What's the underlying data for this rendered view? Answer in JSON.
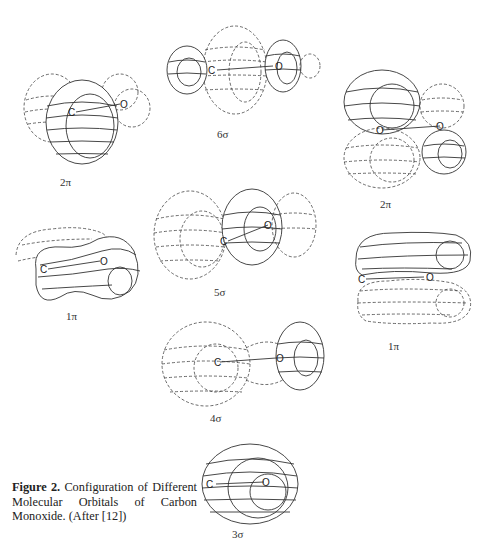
{
  "figure": {
    "caption_label": "Figure 2.",
    "caption_text": " Configuration of Different Molecular Orbitals of Carbon Monoxide. (After [12])",
    "atoms": {
      "carbon": "C",
      "oxygen": "O"
    },
    "orbitals": [
      {
        "id": "2pi-left",
        "label": "2π"
      },
      {
        "id": "6sigma",
        "label": "6σ"
      },
      {
        "id": "2pi-right",
        "label": "2π"
      },
      {
        "id": "5sigma",
        "label": "5σ"
      },
      {
        "id": "1pi-left",
        "label": "1π"
      },
      {
        "id": "1pi-right",
        "label": "1π"
      },
      {
        "id": "4sigma",
        "label": "4σ"
      },
      {
        "id": "3sigma",
        "label": "3σ"
      }
    ]
  }
}
